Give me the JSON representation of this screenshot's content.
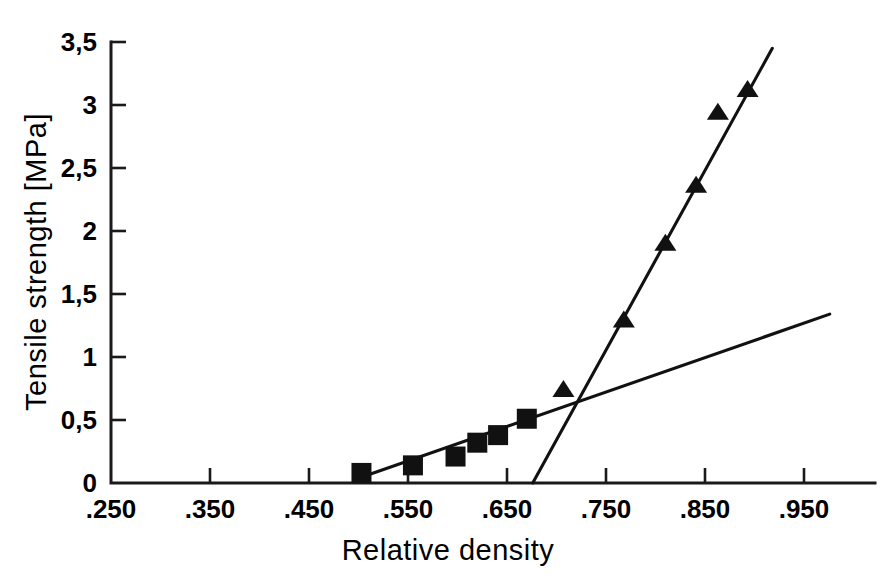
{
  "chart_data": {
    "type": "scatter",
    "title": "",
    "xlabel": "Relative density",
    "ylabel": "Tensile strength [MPa]",
    "xlim": [
      0.25,
      1.0
    ],
    "ylim": [
      0.0,
      3.5
    ],
    "grid": false,
    "legend": "none",
    "xticklabels": [
      ".250",
      ".350",
      ".450",
      ".550",
      ".650",
      ".750",
      ".850",
      ".950"
    ],
    "xtickvalues": [
      0.25,
      0.35,
      0.45,
      0.55,
      0.65,
      0.75,
      0.85,
      0.95
    ],
    "yticklabels": [
      "0",
      "0,5",
      "1",
      "1,5",
      "2",
      "2,5",
      "3",
      "3,5"
    ],
    "ytickvalues": [
      0,
      0.5,
      1,
      1.5,
      2,
      2.5,
      3,
      3.5
    ],
    "series": [
      {
        "name": "squares",
        "marker": "square",
        "color": "#111111",
        "points": [
          {
            "x": 0.503,
            "y": 0.08
          },
          {
            "x": 0.555,
            "y": 0.14
          },
          {
            "x": 0.598,
            "y": 0.21
          },
          {
            "x": 0.62,
            "y": 0.32
          },
          {
            "x": 0.641,
            "y": 0.38
          },
          {
            "x": 0.67,
            "y": 0.51
          }
        ]
      },
      {
        "name": "triangles",
        "marker": "triangle",
        "color": "#111111",
        "points": [
          {
            "x": 0.707,
            "y": 0.74
          },
          {
            "x": 0.768,
            "y": 1.29
          },
          {
            "x": 0.81,
            "y": 1.9
          },
          {
            "x": 0.841,
            "y": 2.36
          },
          {
            "x": 0.863,
            "y": 2.94
          },
          {
            "x": 0.893,
            "y": 3.12
          }
        ]
      }
    ],
    "fit_lines": [
      {
        "name": "shallow-fit-line",
        "x0": 0.497,
        "y0": 0.03,
        "x1": 0.976,
        "y1": 1.34
      },
      {
        "name": "steep-fit-line",
        "x0": 0.676,
        "y0": 0.0,
        "x1": 0.918,
        "y1": 3.45
      }
    ]
  },
  "figure": {
    "caption": ""
  }
}
